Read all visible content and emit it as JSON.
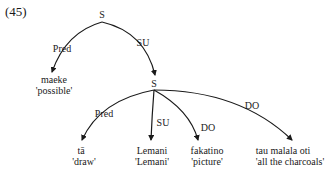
{
  "example_number": "(45)",
  "tree": {
    "root": {
      "label": "S"
    },
    "root_edges": [
      {
        "label": "Pred",
        "target_word": "maeke",
        "target_gloss": "'possible'"
      },
      {
        "label": "SU",
        "target": "S"
      }
    ],
    "embedded": {
      "label": "S"
    },
    "embedded_edges": [
      {
        "label": "Pred",
        "target_word": "tā",
        "target_gloss": "'draw'"
      },
      {
        "label": "SU",
        "target_word": "Lemani",
        "target_gloss": "'Lemani'"
      },
      {
        "label": "DO",
        "target_word": "fakatino",
        "target_gloss": "'picture'"
      },
      {
        "label": "DO",
        "target_word": "tau malala oti",
        "target_gloss": "'all the charcoals'"
      }
    ]
  }
}
